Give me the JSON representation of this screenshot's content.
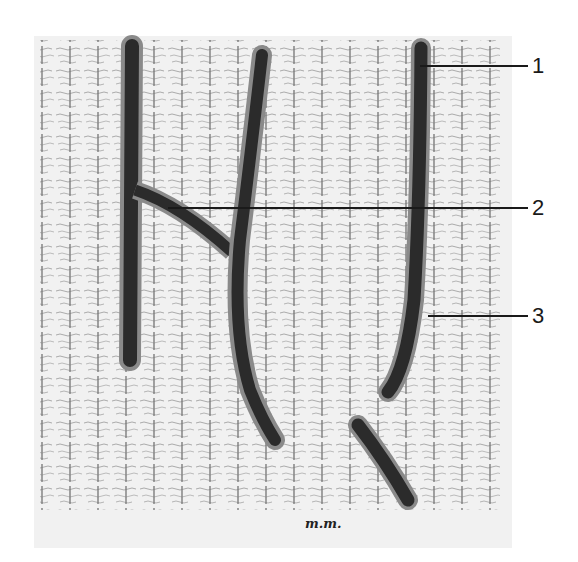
{
  "figure": {
    "type": "histological illustration",
    "signature": "m.m.",
    "colors": {
      "background": "#ffffff",
      "plate": "#f1f1f1",
      "vessel_fill": "#2b2b2b",
      "vessel_wall": "#8a8a8a",
      "fibers": "#6f6f6f",
      "leader_line": "#1a1a1a"
    },
    "labels": [
      {
        "id": "1",
        "text": "1",
        "target": "vessel wall (right vessel)"
      },
      {
        "id": "2",
        "text": "2",
        "target": "vessel branching (Y-junction)"
      },
      {
        "id": "3",
        "text": "3",
        "target": "perivascular cell with processes"
      }
    ]
  }
}
